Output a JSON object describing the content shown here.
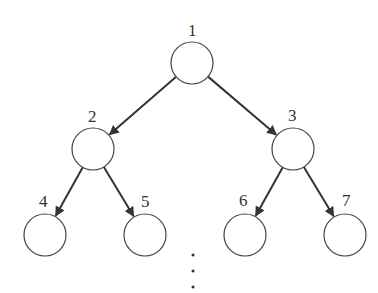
{
  "diagram": {
    "type": "binary-tree",
    "nodes": [
      {
        "id": "1",
        "label": "1",
        "cx": 192,
        "cy": 63
      },
      {
        "id": "2",
        "label": "2",
        "cx": 93,
        "cy": 149
      },
      {
        "id": "3",
        "label": "3",
        "cx": 293,
        "cy": 149
      },
      {
        "id": "4",
        "label": "4",
        "cx": 45,
        "cy": 235
      },
      {
        "id": "5",
        "label": "5",
        "cx": 145,
        "cy": 235
      },
      {
        "id": "6",
        "label": "6",
        "cx": 245,
        "cy": 235
      },
      {
        "id": "7",
        "label": "7",
        "cx": 345,
        "cy": 235
      }
    ],
    "edges": [
      {
        "from": "1",
        "to": "2"
      },
      {
        "from": "1",
        "to": "3"
      },
      {
        "from": "2",
        "to": "4"
      },
      {
        "from": "2",
        "to": "5"
      },
      {
        "from": "3",
        "to": "6"
      },
      {
        "from": "3",
        "to": "7"
      }
    ],
    "continuation": "⋮"
  }
}
